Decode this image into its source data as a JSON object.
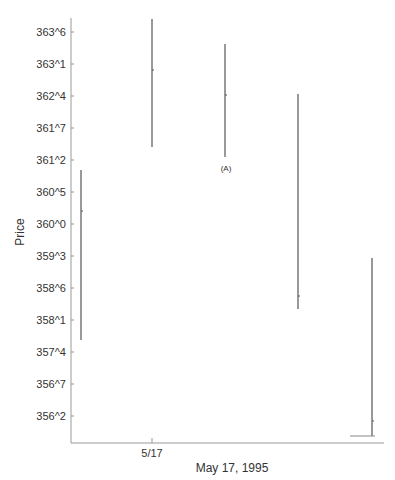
{
  "chart_data": {
    "type": "bar",
    "subtype": "high-low range chart",
    "title": "",
    "xlabel": "May 17, 1995",
    "ylabel": "Price",
    "x_tick_labels": [
      "5/17"
    ],
    "y_tick_labels": [
      "363^6",
      "363^1",
      "362^4",
      "361^7",
      "361^2",
      "360^5",
      "360^0",
      "359^3",
      "358^6",
      "358^1",
      "357^4",
      "356^7",
      "356^2"
    ],
    "ylim_labels": [
      "356^2",
      "363^6"
    ],
    "grid": false,
    "legend": null,
    "annotations": [
      {
        "text": "(A)",
        "bar_index": 2,
        "position": "below"
      }
    ],
    "series": [
      {
        "name": "bar1",
        "x_px": 81,
        "high": "360^6",
        "low": "357^6",
        "close_tick": "360^4"
      },
      {
        "name": "bar2",
        "x_px": 152,
        "high": "363^7",
        "low": "361^3",
        "close_tick": "362^7"
      },
      {
        "name": "bar3",
        "x_px": 225,
        "high": "363^0",
        "low": "361^2",
        "close_tick": "362^2"
      },
      {
        "name": "bar4",
        "x_px": 298,
        "high": "362^1",
        "low": "358^3",
        "close_tick": "358^5"
      },
      {
        "name": "bar5",
        "x_px": 372,
        "high": "359^0",
        "low": "355^7",
        "close_tick": "356^0"
      }
    ]
  },
  "axes": {
    "ylabel": "Price",
    "xlabel": "May 17, 1995",
    "xtick": "5/17",
    "annotation": "(A)"
  }
}
